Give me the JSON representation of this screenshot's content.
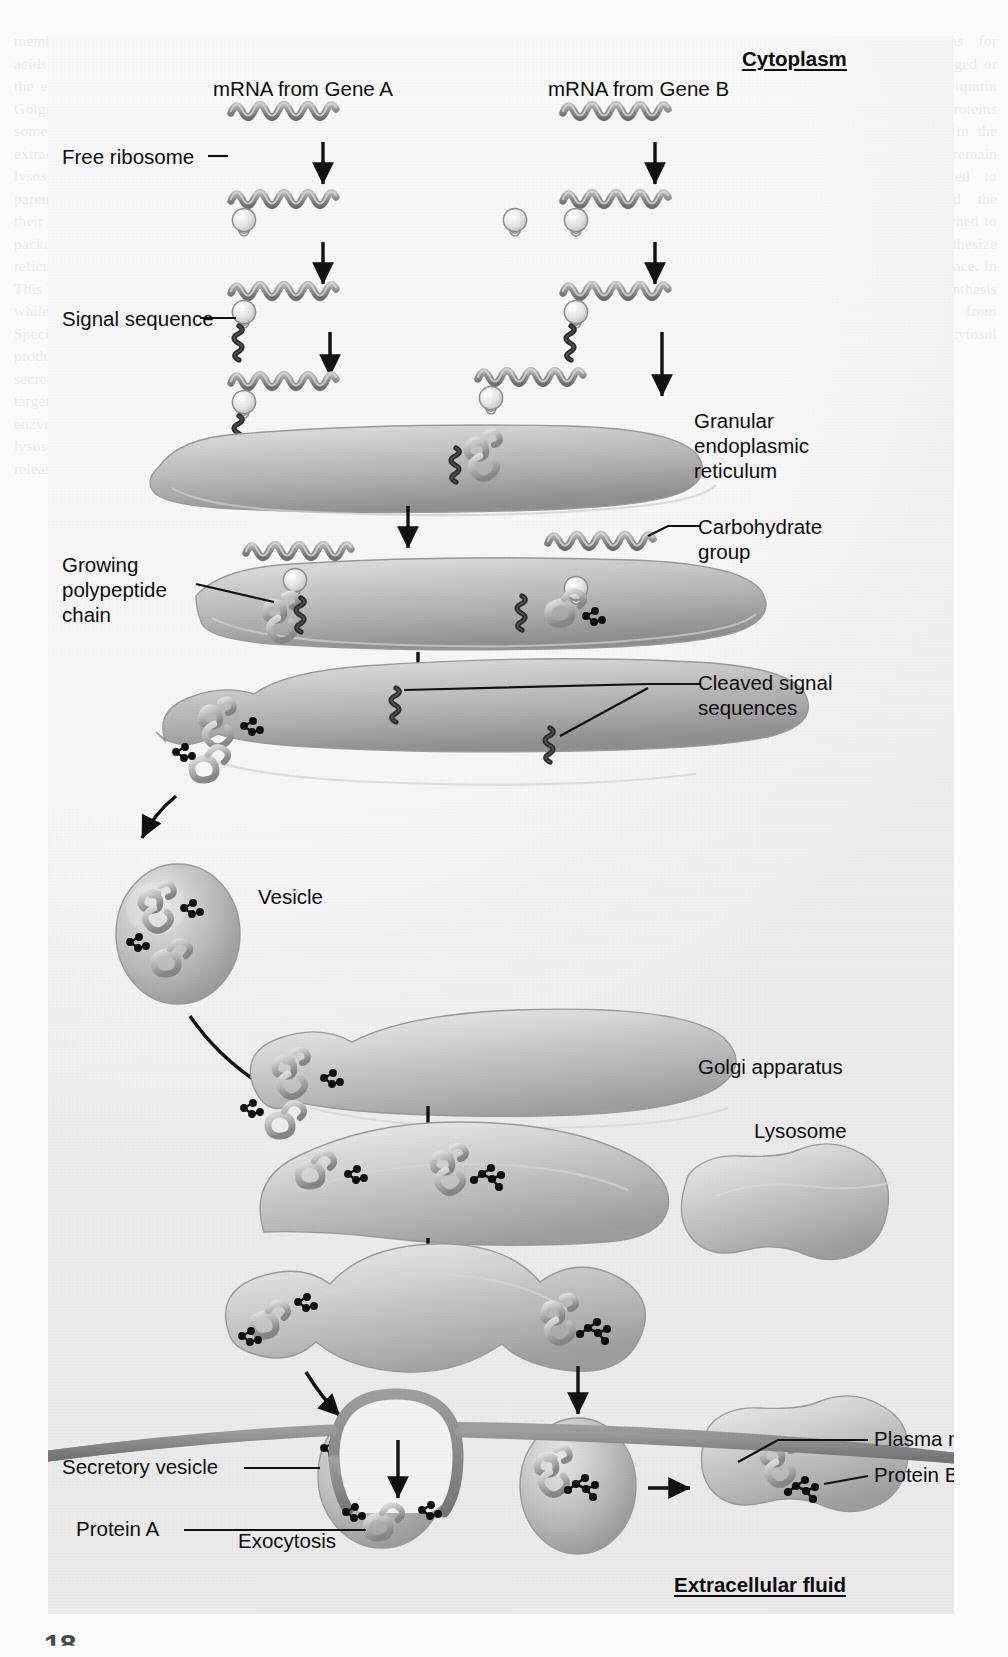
{
  "figure": {
    "region_labels": {
      "cytoplasm": "Cytoplasm",
      "extracellular_fluid": "Extracellular fluid"
    },
    "column_headers": {
      "gene_a": "mRNA from Gene A",
      "gene_b": "mRNA from Gene B"
    },
    "labels": [
      {
        "id": "free-ribosome",
        "text": "Free ribosome"
      },
      {
        "id": "signal-sequence",
        "text": "Signal sequence"
      },
      {
        "id": "granular-er",
        "text": "Granular\nendoplasmic\nreticulum"
      },
      {
        "id": "carbohydrate-group",
        "text": "Carbohydrate\ngroup"
      },
      {
        "id": "growing-polypeptide",
        "text": "Growing\npolypeptide\nchain"
      },
      {
        "id": "cleaved-signal",
        "text": "Cleaved signal\nsequences"
      },
      {
        "id": "vesicle",
        "text": "Vesicle"
      },
      {
        "id": "golgi-apparatus",
        "text": "Golgi apparatus"
      },
      {
        "id": "lysosome",
        "text": "Lysosome"
      },
      {
        "id": "secretory-vesicle",
        "text": "Secretory vesicle"
      },
      {
        "id": "exocytosis",
        "text": "Exocytosis"
      },
      {
        "id": "protein-a",
        "text": "Protein A"
      },
      {
        "id": "protein-b",
        "text": "Protein B"
      },
      {
        "id": "plasma-membrane",
        "text": "Plasma membrane"
      }
    ],
    "structures": [
      {
        "name": "mrna-strand",
        "count": 8,
        "depicts": "wavy mRNA molecule"
      },
      {
        "name": "ribosome",
        "count": 8,
        "depicts": "small light sphere with nub"
      },
      {
        "name": "signal-sequence-chain",
        "count": 6,
        "depicts": "dark beaded peptide tail"
      },
      {
        "name": "granular-er-cisterna",
        "count": 3,
        "depicts": "elongated curved sac"
      },
      {
        "name": "transport-vesicle",
        "count": 4,
        "depicts": "round membrane-bound sphere"
      },
      {
        "name": "golgi-cisterna",
        "count": 3,
        "depicts": "curved flattened sac"
      },
      {
        "name": "lysosome-body",
        "count": 2,
        "depicts": "irregular rounded organelle"
      },
      {
        "name": "folded-protein",
        "count": 14,
        "depicts": "coiled grey polypeptide"
      },
      {
        "name": "carbohydrate-cluster",
        "count": 12,
        "depicts": "branched cluster of dark spheres"
      },
      {
        "name": "plasma-membrane-band",
        "count": 1,
        "depicts": "thick grey horizontal band"
      },
      {
        "name": "exocytosis-bud",
        "count": 1,
        "depicts": "membrane evagination / pore"
      }
    ],
    "arrows": {
      "straight_down": 10,
      "curved": 2,
      "diagonal": 3,
      "horizontal": 1,
      "meaning": "direction of the biosynthetic / secretory flow"
    },
    "colors": {
      "panel_background": "#ececec",
      "organelle_fill": "#b9b9b9",
      "organelle_light": "#dedede",
      "organelle_dark": "#8e8e8e",
      "mrna": "#8c8c8c",
      "signal_sequence": "#2f2f2f",
      "carbohydrate": "#111111",
      "membrane": "#8a8a8a",
      "label_text": "#0d0d0d",
      "leader_line": "#1a1a1a"
    },
    "page_folio": "18"
  },
  "background_text": {
    "left_column": "membranes receptors that recognize and bind with proteins. Amino acids are assembled into protein molecules on ribosomes attached to the endoplasmic reticulum membranes. Vesicles derived from the Golgi apparatus carry the proteins toward the plasma membrane and some vesicles fuse with it, releasing their contents to the extracellular fluid. Other vesicles remain within the cytoplasm as lysosomes containing digestive enzymes. Write in the text in parentheses the amino acid sequence responsible for directing to their destinations. The signal sequence is removed as the protein is packaged into the cisternal space of the granular endoplasmic reticulum. Proteins that lack a signal sequence remain in the cytosol. This process is known as cotranslational translocation and occurs while the polypeptide is still being synthesized on the ribosome. Specific carbohydrate groups are added in the Golgi apparatus, producing glycoproteins destined for the plasma membrane or secretion. Vesicles bud from the trans face of the Golgi and are targeted to their final destinations by membrane markers. Lysosomal enzymes carry mannose-6-phosphate tags that direct them to lysosomes, while secretory proteins collect in secretory vesicles for release by exocytosis.",
    "right_column": "Cells also contain mechanisms for degrading proteins that are damaged or no longer needed. The ubiquitin proteasome system tags such proteins for destruction. Free ribosomes in the cytosol synthesize proteins that remain in the cytosol or are targeted to mitochondria, peroxisomes and the nucleus. Ribosomes that are attached to the endoplasmic reticulum synthesize proteins that enter the cisternal space. In this way the cell separates the synthesis of proteins destined for export from those that function within the cytosol itself."
  }
}
